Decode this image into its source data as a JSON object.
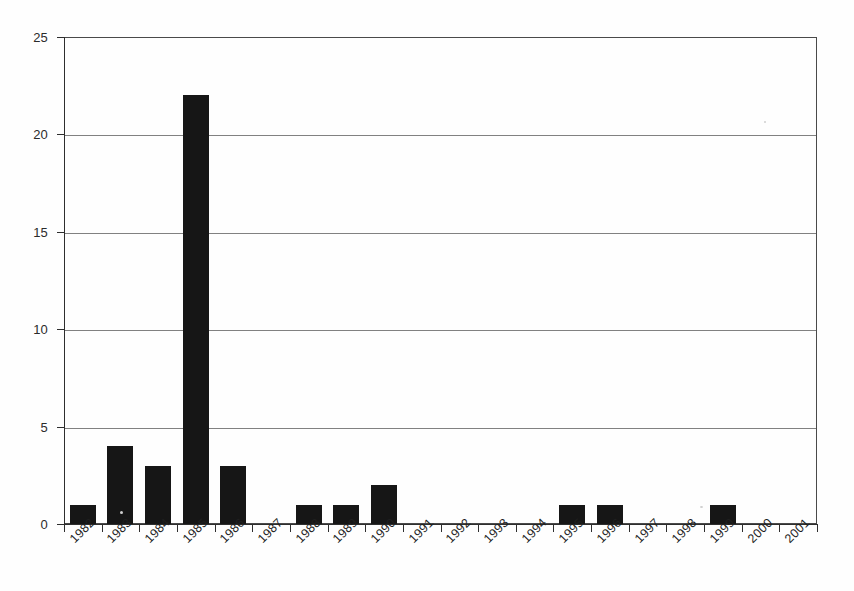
{
  "chart_data": {
    "type": "bar",
    "title": "",
    "subtitle": "",
    "xlabel": "",
    "ylabel": "",
    "categories": [
      "1982",
      "1983",
      "1984",
      "1985",
      "1986",
      "1987",
      "1988",
      "1989",
      "1990",
      "1991",
      "1992",
      "1993",
      "1994",
      "1995",
      "1996",
      "1997",
      "1998",
      "1999",
      "2000",
      "2001"
    ],
    "values": [
      1,
      4,
      3,
      22,
      3,
      0,
      1,
      1,
      2,
      0,
      0,
      0,
      0,
      1,
      1,
      0,
      0,
      1,
      0,
      0
    ],
    "series": [
      {
        "name": "",
        "values": [
          1,
          4,
          3,
          22,
          3,
          0,
          1,
          1,
          2,
          0,
          0,
          0,
          0,
          1,
          1,
          0,
          0,
          1,
          0,
          0
        ]
      }
    ],
    "ylim": [
      0,
      25
    ],
    "y_ticks": [
      0,
      5,
      10,
      15,
      20,
      25
    ],
    "y_tick_labels": [
      "0",
      "5",
      "10",
      "15",
      "20",
      "25"
    ],
    "grid": true,
    "grid_axis": "y",
    "legend": false,
    "legend_position": "none",
    "bar_color": "#161616",
    "grid_color": "#6b6b6b",
    "axis_color": "#2e2e2e",
    "background_color": "#fefefe",
    "x_tick_rotation": -45,
    "annotations": []
  }
}
